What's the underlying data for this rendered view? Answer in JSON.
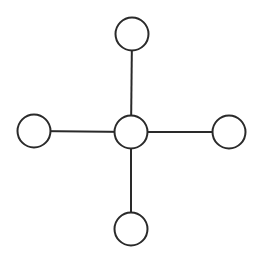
{
  "diagram": {
    "type": "star-graph",
    "colors": {
      "stroke": "#2a2a2a",
      "node_fill": "#ffffff",
      "background": "#ffffff"
    },
    "nodes": [
      {
        "id": "center",
        "role": "hub"
      },
      {
        "id": "top",
        "role": "leaf"
      },
      {
        "id": "left",
        "role": "leaf"
      },
      {
        "id": "right",
        "role": "leaf"
      },
      {
        "id": "bottom",
        "role": "leaf"
      }
    ],
    "edges": [
      {
        "from": "center",
        "to": "top"
      },
      {
        "from": "center",
        "to": "left"
      },
      {
        "from": "center",
        "to": "right"
      },
      {
        "from": "center",
        "to": "bottom"
      }
    ]
  }
}
